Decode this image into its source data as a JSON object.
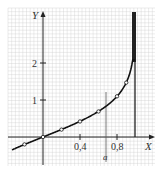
{
  "chart_data": {
    "type": "line",
    "title": "",
    "xlabel": "X",
    "ylabel": "Y",
    "xlim": [
      -0.32,
      1.2
    ],
    "ylim": [
      -0.75,
      3.4
    ],
    "grid": true,
    "x_ticks": [
      0.4,
      0.8
    ],
    "x_tick_labels": [
      "0,4",
      "0,8"
    ],
    "y_ticks": [
      1,
      2
    ],
    "y_tick_labels": [
      "1",
      "2"
    ],
    "series": [
      {
        "name": "curve",
        "function": "artanh(x)",
        "points": [
          {
            "x": -0.2,
            "y": -0.2
          },
          {
            "x": 0.0,
            "y": 0.0
          },
          {
            "x": 0.2,
            "y": 0.2
          },
          {
            "x": 0.4,
            "y": 0.42
          },
          {
            "x": 0.6,
            "y": 0.69
          },
          {
            "x": 0.8,
            "y": 1.1
          },
          {
            "x": 0.9,
            "y": 1.47
          }
        ]
      }
    ],
    "annotations": [
      {
        "type": "vertical-line",
        "x": 0.68,
        "label": "a"
      },
      {
        "type": "asymptote",
        "x": 1.0
      }
    ]
  },
  "labels": {
    "x_axis": "X",
    "y_axis": "Y",
    "tick_x1": "0,4",
    "tick_x2": "0,8",
    "tick_y1": "1",
    "tick_y2": "2",
    "marker_a": "a"
  },
  "colors": {
    "grid": "#c8c8c8",
    "axis": "#222222",
    "curve": "#111111"
  }
}
